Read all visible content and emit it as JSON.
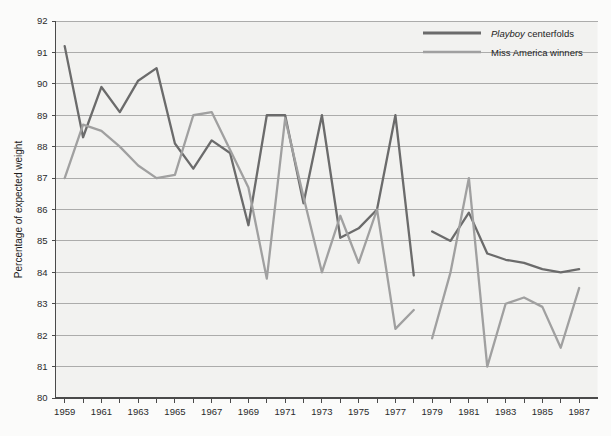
{
  "chart_data": {
    "type": "line",
    "title": "",
    "xlabel": "",
    "ylabel": "Percentage of expected weight",
    "xlim": [
      1958.5,
      1988.0
    ],
    "ylim": [
      80,
      92
    ],
    "yticks": [
      80,
      81,
      82,
      83,
      84,
      85,
      86,
      87,
      88,
      89,
      90,
      91,
      92
    ],
    "ytick_labels": [
      "80",
      "81",
      "82",
      "83",
      "84",
      "85",
      "86",
      "87",
      "88",
      "89",
      "90",
      "91",
      "92"
    ],
    "xticks": [
      1959,
      1960,
      1961,
      1962,
      1963,
      1964,
      1965,
      1966,
      1967,
      1968,
      1969,
      1970,
      1971,
      1972,
      1973,
      1974,
      1975,
      1976,
      1977,
      1978,
      1979,
      1980,
      1981,
      1982,
      1983,
      1984,
      1985,
      1986,
      1987
    ],
    "xtick_labels": [
      "1959",
      "1961",
      "1963",
      "1965",
      "1967",
      "1969",
      "1971",
      "1973",
      "1975",
      "1977",
      "1979",
      "1981",
      "1983",
      "1985",
      "1987"
    ],
    "xtick_labelled_years": [
      1959,
      1961,
      1963,
      1965,
      1967,
      1969,
      1971,
      1973,
      1975,
      1977,
      1979,
      1981,
      1983,
      1985,
      1987
    ],
    "grid": "horizontal",
    "legend_position": "top-right",
    "series": [
      {
        "name": "Playboy centerfolds",
        "name_italic_prefix": "Playboy",
        "name_rest": " centerfolds",
        "color": "#6b6b6b",
        "width": 2.3,
        "segments": [
          {
            "x": [
              1959,
              1960,
              1961,
              1962,
              1963,
              1964,
              1965,
              1966,
              1967,
              1968,
              1969,
              1970,
              1971,
              1972,
              1973,
              1974,
              1975,
              1976,
              1977,
              1978
            ],
            "y": [
              91.2,
              88.3,
              89.9,
              89.1,
              90.1,
              90.5,
              88.1,
              87.3,
              88.2,
              87.8,
              85.5,
              89.0,
              89.0,
              86.2,
              89.0,
              85.1,
              85.4,
              86.0,
              89.0,
              83.9
            ]
          },
          {
            "x": [
              1979,
              1980,
              1981,
              1982,
              1983,
              1984,
              1985,
              1986,
              1987
            ],
            "y": [
              85.3,
              85.0,
              85.9,
              84.6,
              84.4,
              84.3,
              84.1,
              84.0,
              84.1
            ]
          }
        ]
      },
      {
        "name": "Miss America winners",
        "color": "#a0a0a0",
        "width": 2.3,
        "segments": [
          {
            "x": [
              1959,
              1960,
              1961,
              1962,
              1963,
              1964,
              1965,
              1966,
              1967,
              1968,
              1969,
              1970,
              1971,
              1972,
              1973,
              1974,
              1975,
              1976,
              1977,
              1978
            ],
            "y": [
              87.0,
              88.7,
              88.5,
              88.0,
              87.4,
              87.0,
              87.1,
              89.0,
              89.1,
              87.9,
              86.7,
              83.8,
              88.9,
              86.4,
              84.0,
              85.8,
              84.3,
              86.0,
              82.2,
              82.8
            ]
          },
          {
            "x": [
              1979,
              1980,
              1981,
              1982,
              1983,
              1984,
              1985,
              1986,
              1987
            ],
            "y": [
              81.9,
              84.0,
              87.0,
              81.0,
              83.0,
              83.2,
              82.9,
              81.6,
              83.5,
              82.6
            ]
          }
        ]
      }
    ]
  },
  "legend": {
    "items": [
      {
        "label_italic": "Playboy",
        "label_rest": " centerfolds",
        "color": "#6b6b6b"
      },
      {
        "label_italic": "",
        "label_rest": "Miss America winners",
        "color": "#a0a0a0"
      }
    ]
  },
  "axes": {
    "y_axis_title": "Percentage of expected weight"
  },
  "colors": {
    "background": "#fbfbfa",
    "plot_background": "#f2f2f0",
    "grid": "#9a9a9a",
    "axis": "#4a4a4a",
    "playboy_line": "#6b6b6b",
    "miss_america_line": "#a0a0a0",
    "text": "#1c1c1c"
  }
}
